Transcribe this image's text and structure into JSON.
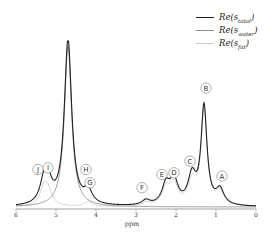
{
  "chart_data": {
    "type": "line",
    "title": "",
    "xlabel": "ppm",
    "ylabel": "",
    "xlim": [
      6,
      0
    ],
    "x_reversed": true,
    "xticks": [
      "6",
      "5",
      "4",
      "3",
      "2",
      "1",
      "0"
    ],
    "grid": false,
    "legend_position": "upper right",
    "legend": [
      {
        "label_base": "Re",
        "label_sub": "total",
        "color": "#222222"
      },
      {
        "label_base": "Re",
        "label_sub": "water",
        "color": "#8c8c8c"
      },
      {
        "label_base": "Re",
        "label_sub": "fat",
        "color": "#c8c8c8"
      }
    ],
    "series": [
      {
        "name": "Re(s_total)",
        "color": "#222222",
        "peaks_ppm_height": [
          [
            4.7,
            1.0
          ],
          [
            5.3,
            0.12
          ],
          [
            5.2,
            0.12
          ],
          [
            4.2,
            0.08
          ],
          [
            2.75,
            0.03
          ],
          [
            2.25,
            0.12
          ],
          [
            2.05,
            0.14
          ],
          [
            1.6,
            0.17
          ],
          [
            1.3,
            0.59
          ],
          [
            0.9,
            0.09
          ]
        ]
      },
      {
        "name": "Re(s_water)",
        "color": "#8c8c8c",
        "peaks_ppm_height": [
          [
            4.7,
            0.97
          ]
        ]
      },
      {
        "name": "Re(s_fat)",
        "color": "#c8c8c8",
        "peaks_ppm_height": [
          [
            5.3,
            0.1
          ],
          [
            5.2,
            0.08
          ],
          [
            4.2,
            0.03
          ],
          [
            2.75,
            0.02
          ],
          [
            2.25,
            0.1
          ],
          [
            2.05,
            0.12
          ],
          [
            1.6,
            0.14
          ],
          [
            1.3,
            0.57
          ],
          [
            0.9,
            0.08
          ]
        ]
      }
    ],
    "annotations": [
      {
        "text": "A",
        "ppm": 0.85,
        "height": 0.15
      },
      {
        "text": "B",
        "ppm": 1.25,
        "height": 0.68
      },
      {
        "text": "C",
        "ppm": 1.65,
        "height": 0.24
      },
      {
        "text": "D",
        "ppm": 2.05,
        "height": 0.17
      },
      {
        "text": "E",
        "ppm": 2.35,
        "height": 0.16
      },
      {
        "text": "F",
        "ppm": 2.85,
        "height": 0.08
      },
      {
        "text": "G",
        "ppm": 4.15,
        "height": 0.11
      },
      {
        "text": "H",
        "ppm": 4.25,
        "height": 0.19
      },
      {
        "text": "I",
        "ppm": 5.2,
        "height": 0.2
      },
      {
        "text": "J",
        "ppm": 5.45,
        "height": 0.19
      }
    ]
  }
}
